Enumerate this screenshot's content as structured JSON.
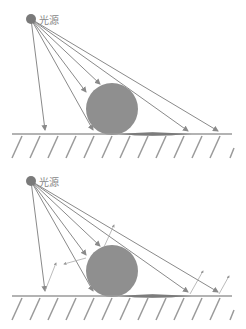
{
  "panels": [
    {
      "id": "top",
      "label": "光源",
      "reflections": false
    },
    {
      "id": "bottom",
      "label": "光源",
      "reflections": true
    }
  ],
  "colors": {
    "ray": "#8a8a8a",
    "sphere": "#8f8f8f",
    "light": "#7a7a7a",
    "ground": "#9a9a9a",
    "shadow": "#222222"
  }
}
